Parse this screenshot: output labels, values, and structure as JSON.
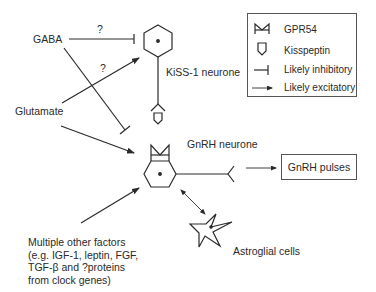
{
  "diagram": {
    "inputs": {
      "gaba": "GABA",
      "glutamate": "Glutamate",
      "question_gaba": "?",
      "question_glutamate": "?",
      "other_factors": [
        "Multiple other factors",
        "(e.g. IGF-1, leptin, FGF,",
        "TGF-β and ?proteins",
        "from clock genes)"
      ]
    },
    "nodes": {
      "kiss1": "KiSS-1 neurone",
      "gnrh": "GnRH neurone",
      "astroglia": "Astroglial cells",
      "pulses": "GnRH pulses"
    },
    "legend": {
      "items": [
        {
          "icon": "gpr54-receptor-icon",
          "label": "GPR54"
        },
        {
          "icon": "kisspeptin-icon",
          "label": "Kisspeptin"
        },
        {
          "icon": "inhibitory-line-icon",
          "label": "Likely inhibitory"
        },
        {
          "icon": "excitatory-arrow-icon",
          "label": "Likely excitatory"
        }
      ]
    },
    "colors": {
      "line": "#2a2a2a",
      "border": "#555555",
      "background": "#ffffff"
    }
  }
}
